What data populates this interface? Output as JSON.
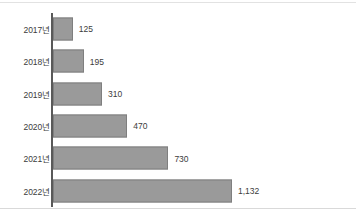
{
  "chart_data": {
    "type": "bar",
    "orientation": "horizontal",
    "title": "",
    "subtitle": "",
    "xlabel": "",
    "ylabel": "",
    "categories": [
      "2017년",
      "2018년",
      "2019년",
      "2020년",
      "2021년",
      "2022년"
    ],
    "values": [
      125,
      195,
      310,
      470,
      730,
      1132
    ],
    "value_labels": [
      "125",
      "195",
      "310",
      "470",
      "730",
      "1,132"
    ],
    "xlim": [
      0,
      1132
    ],
    "grid": false,
    "legend": false,
    "legend_position": "none",
    "series": [
      {
        "name": "",
        "values": [
          125,
          195,
          310,
          470,
          730,
          1132
        ]
      }
    ],
    "colors": {
      "bar_fill": "#9a9a9a",
      "bar_border": "#7f7f7f",
      "axis_line": "#595959",
      "label_text": "#3c3c3c",
      "background": "#ffffff",
      "rule": "#e2e2e2"
    }
  }
}
